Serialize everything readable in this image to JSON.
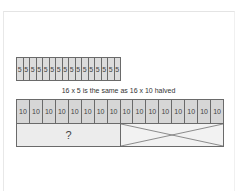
{
  "diagram": {
    "fives_strip": {
      "count": 16,
      "cells": [
        "5",
        "5",
        "5",
        "5",
        "5",
        "5",
        "5",
        "5",
        "5",
        "5",
        "5",
        "5",
        "5",
        "5",
        "5",
        "5"
      ]
    },
    "caption": "16 x 5 is the same as 16 x 10 halved",
    "tens_bar": {
      "count": 16,
      "cells": [
        "10",
        "10",
        "10",
        "10",
        "10",
        "10",
        "10",
        "10",
        "10",
        "10",
        "10",
        "10",
        "10",
        "10",
        "10",
        "10"
      ]
    },
    "unknown_half": {
      "label": "?"
    },
    "crossed_half": {
      "mark": "x-cross"
    },
    "colors": {
      "cell_fill": "#dcdcdc",
      "cell_border": "#6a6a6a",
      "half_fill": "#ececec",
      "text": "#444444"
    }
  }
}
